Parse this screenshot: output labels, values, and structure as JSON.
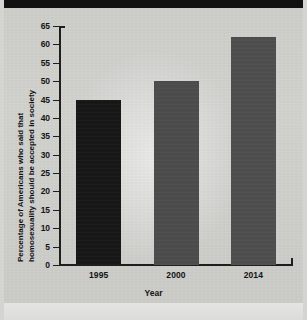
{
  "figure": {
    "top_band": "black-bar",
    "background_color": "#d3d3d0"
  },
  "chart_data": {
    "type": "bar",
    "title": "",
    "categories": [
      "1995",
      "2000",
      "2014"
    ],
    "values": [
      45,
      50,
      62
    ],
    "xlabel": "Year",
    "ylabel_line1": "Percentage of Americans who said that",
    "ylabel_line2": "homosexuality should be accepted in society",
    "ylim": [
      0,
      65
    ],
    "ytick_step": 5,
    "yticks": [
      "0",
      "5",
      "10",
      "15",
      "20",
      "25",
      "30",
      "35",
      "40",
      "45",
      "50",
      "55",
      "60",
      "65"
    ],
    "grid": false,
    "legend": "none",
    "bar_colors": [
      "#171717",
      "#4c4c4c",
      "#4e4e4e"
    ]
  }
}
